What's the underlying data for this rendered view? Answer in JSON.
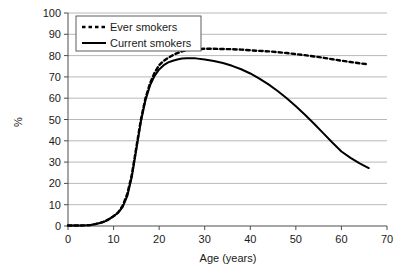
{
  "chart_data": {
    "type": "line",
    "title": "",
    "xlabel": "Age (years)",
    "ylabel": "%",
    "xlim": [
      0,
      70
    ],
    "ylim": [
      0,
      100
    ],
    "xticks": [
      0,
      10,
      20,
      30,
      40,
      50,
      60,
      70
    ],
    "yticks": [
      0,
      10,
      20,
      30,
      40,
      50,
      60,
      70,
      80,
      90,
      100
    ],
    "grid": "horizontal",
    "legend_position": "top-left-inside",
    "series": [
      {
        "name": "Ever smokers",
        "style": "dashed",
        "color": "#000000",
        "x": [
          0,
          2,
          4,
          5,
          6,
          7,
          8,
          9,
          10,
          11,
          12,
          13,
          14,
          15,
          16,
          17,
          18,
          19,
          20,
          21,
          22,
          23,
          24,
          25,
          26,
          27,
          28,
          30,
          32,
          34,
          36,
          38,
          40,
          42,
          44,
          46,
          48,
          50,
          52,
          54,
          56,
          58,
          60,
          62,
          64,
          66
        ],
        "y": [
          0.2,
          0.2,
          0.3,
          0.5,
          0.9,
          1.4,
          2.1,
          3.2,
          4.6,
          6.4,
          9.5,
          15.0,
          24.0,
          37.0,
          50.0,
          60.0,
          67.0,
          72.0,
          75.5,
          77.5,
          79.0,
          80.2,
          81.2,
          82.0,
          82.5,
          82.8,
          83.0,
          83.2,
          83.2,
          83.1,
          83.0,
          82.8,
          82.5,
          82.2,
          82.0,
          81.6,
          81.2,
          80.7,
          80.2,
          79.6,
          79.0,
          78.3,
          77.6,
          77.0,
          76.4,
          75.9
        ]
      },
      {
        "name": "Current smokers",
        "style": "solid",
        "color": "#000000",
        "x": [
          0,
          2,
          4,
          5,
          6,
          7,
          8,
          9,
          10,
          11,
          12,
          13,
          14,
          15,
          16,
          17,
          18,
          19,
          20,
          21,
          22,
          23,
          24,
          25,
          26,
          27,
          28,
          30,
          32,
          34,
          36,
          38,
          40,
          42,
          44,
          46,
          48,
          50,
          52,
          54,
          56,
          58,
          60,
          62,
          64,
          66
        ],
        "y": [
          0.2,
          0.2,
          0.3,
          0.5,
          0.9,
          1.4,
          2.1,
          3.2,
          4.6,
          6.2,
          9.0,
          14.0,
          23.0,
          36.0,
          49.0,
          59.0,
          66.0,
          70.5,
          73.5,
          75.5,
          76.8,
          77.6,
          78.2,
          78.6,
          78.8,
          78.8,
          78.7,
          78.2,
          77.5,
          76.5,
          75.2,
          73.6,
          71.6,
          69.2,
          66.5,
          63.4,
          60.0,
          56.2,
          52.2,
          48.0,
          43.6,
          39.2,
          35.0,
          32.0,
          29.4,
          27.2
        ]
      }
    ]
  },
  "legend": {
    "items": [
      {
        "label": "Ever smokers",
        "style": "dashed"
      },
      {
        "label": "Current smokers",
        "style": "solid"
      }
    ]
  },
  "axes": {
    "x_title": "Age (years)",
    "y_title": "%",
    "x_tick_labels": [
      "0",
      "10",
      "20",
      "30",
      "40",
      "50",
      "60",
      "70"
    ],
    "y_tick_labels": [
      "0",
      "10",
      "20",
      "30",
      "40",
      "50",
      "60",
      "70",
      "80",
      "90",
      "100"
    ]
  },
  "colors": {
    "line": "#000000",
    "grid": "#a6a6a6",
    "axis": "#4d4d4d",
    "text": "#1a1a1a",
    "background": "#ffffff"
  }
}
